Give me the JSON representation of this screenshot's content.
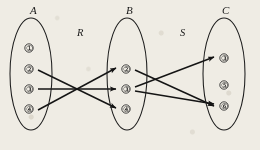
{
  "figure": {
    "type": "relation-composition-diagram",
    "background_color": "#efece4",
    "ink_color": "#1a1a1a"
  },
  "sets": [
    {
      "id": "A",
      "label": "A",
      "label_x": 30,
      "label_y": 14,
      "cx": 31,
      "cy": 74,
      "rx": 21,
      "ry": 56,
      "elements": [
        {
          "value": "①",
          "cx": 29,
          "cy": 48
        },
        {
          "value": "②",
          "cx": 29,
          "cy": 69
        },
        {
          "value": "③",
          "cx": 29,
          "cy": 89
        },
        {
          "value": "④",
          "cx": 29,
          "cy": 109
        }
      ]
    },
    {
      "id": "B",
      "label": "B",
      "label_x": 126,
      "label_y": 14,
      "cx": 127,
      "cy": 74,
      "rx": 20,
      "ry": 56,
      "elements": [
        {
          "value": "②",
          "cx": 126,
          "cy": 69
        },
        {
          "value": "③",
          "cx": 126,
          "cy": 89
        },
        {
          "value": "④",
          "cx": 126,
          "cy": 109
        }
      ]
    },
    {
      "id": "C",
      "label": "C",
      "label_x": 222,
      "label_y": 14,
      "cx": 224,
      "cy": 74,
      "rx": 21,
      "ry": 56,
      "elements": [
        {
          "value": "③",
          "cx": 224,
          "cy": 58
        },
        {
          "value": "⑤",
          "cx": 224,
          "cy": 85
        },
        {
          "value": "⑥",
          "cx": 224,
          "cy": 106
        }
      ]
    }
  ],
  "relations": [
    {
      "name": "R",
      "label": "R",
      "label_x": 77,
      "label_y": 36,
      "from_set": "A",
      "to_set": "B",
      "edges": [
        {
          "from": "②",
          "to": "④",
          "x1": 38,
          "y1": 70,
          "x2": 116,
          "y2": 108
        },
        {
          "from": "③",
          "to": "③",
          "x1": 38,
          "y1": 89,
          "x2": 116,
          "y2": 89
        },
        {
          "from": "④",
          "to": "②",
          "x1": 38,
          "y1": 110,
          "x2": 116,
          "y2": 68
        }
      ]
    },
    {
      "name": "S",
      "label": "S",
      "label_x": 180,
      "label_y": 36,
      "from_set": "B",
      "to_set": "C",
      "edges": [
        {
          "from": "②",
          "to": "⑥",
          "x1": 135,
          "y1": 70,
          "x2": 214,
          "y2": 106
        },
        {
          "from": "③",
          "to": "③",
          "x1": 135,
          "y1": 87,
          "x2": 214,
          "y2": 57
        },
        {
          "from": "③",
          "to": "⑥",
          "x1": 135,
          "y1": 91,
          "x2": 214,
          "y2": 104
        }
      ]
    }
  ]
}
